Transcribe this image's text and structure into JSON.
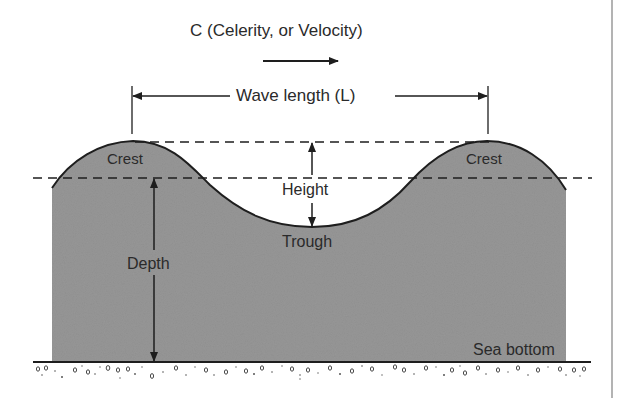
{
  "diagram": {
    "title": "C (Celerity, or Velocity)",
    "labels": {
      "wave_length": "Wave length (L)",
      "crest_left": "Crest",
      "crest_right": "Crest",
      "height": "Height",
      "trough": "Trough",
      "depth": "Depth",
      "sea_bottom": "Sea bottom"
    },
    "colors": {
      "water": "#8f8f8f",
      "line": "#1e1e1e",
      "text": "#2a2a2a",
      "background": "#ffffff",
      "border": "#9a9a9a"
    },
    "elements": [
      "direction-arrow",
      "wave-length-dimension",
      "crest-level-dashed-line",
      "still-water-dashed-line",
      "height-dimension",
      "depth-dimension",
      "sea-bottom-line",
      "sediment-pattern"
    ]
  }
}
